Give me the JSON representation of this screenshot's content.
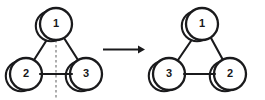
{
  "figure": {
    "background_color": "#ffffff",
    "stroke_color": "#1a1a1c",
    "mirror_color": "#9a9a9a",
    "structures": [
      {
        "id": "left-structure",
        "name": "reactant-structure",
        "nodes": [
          {
            "id": "left-node-top",
            "label": "1",
            "cx": 56,
            "cy": 24,
            "r": 16
          },
          {
            "id": "left-node-bottom-left",
            "label": "2",
            "cx": 26,
            "cy": 74,
            "r": 16
          },
          {
            "id": "left-node-bottom-right",
            "label": "3",
            "cx": 86,
            "cy": 74,
            "r": 16
          }
        ],
        "bonds": [
          {
            "from": "1",
            "to": "2"
          },
          {
            "from": "1",
            "to": "3"
          },
          {
            "from": "2",
            "to": "3"
          }
        ],
        "mirror_plane": {
          "name": "mirror-plane-dashed-line",
          "x": 56,
          "y_top": 30,
          "y_bottom": 98,
          "style": "dashed"
        }
      },
      {
        "id": "right-structure",
        "name": "product-structure",
        "nodes": [
          {
            "id": "right-node-top",
            "label": "1",
            "cx": 202,
            "cy": 24,
            "r": 16
          },
          {
            "id": "right-node-bottom-left",
            "label": "3",
            "cx": 169,
            "cy": 74,
            "r": 16
          },
          {
            "id": "right-node-bottom-right",
            "label": "2",
            "cx": 230,
            "cy": 74,
            "r": 16
          }
        ],
        "bonds": [
          {
            "from": "1",
            "to": "3"
          },
          {
            "from": "1",
            "to": "2"
          },
          {
            "from": "3",
            "to": "2"
          }
        ],
        "mirror_plane": null
      }
    ],
    "arrow": {
      "name": "transformation-arrow",
      "direction": "right",
      "x_start": 103,
      "x_end": 144,
      "y": 49,
      "label": ""
    }
  }
}
